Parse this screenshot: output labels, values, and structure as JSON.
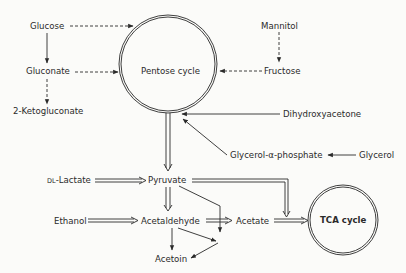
{
  "diagram": {
    "type": "metabolic-pathway",
    "nodes": {
      "glucose": "Glucose",
      "gluconate": "Gluconate",
      "ketogluconate": "2-Ketogluconate",
      "pentose_cycle": "Pentose cycle",
      "mannitol": "Mannitol",
      "fructose": "Fructose",
      "dihydroxyacetone": "Dihydroxyacetone",
      "glycerol_phosphate": "Glycerol-α-phosphate",
      "glycerol": "Glycerol",
      "lactate_prefix": "DL",
      "lactate": "-Lactate",
      "pyruvate": "Pyruvate",
      "ethanol": "Ethanol",
      "acetaldehyde": "Acetaldehyde",
      "acetate": "Acetate",
      "acetoin": "Acetoin",
      "tca_cycle": "TCA cycle"
    },
    "edges": [
      {
        "from": "Glucose",
        "to": "Pentose cycle",
        "style": "dashed"
      },
      {
        "from": "Glucose",
        "to": "Gluconate",
        "style": "solid"
      },
      {
        "from": "Gluconate",
        "to": "Pentose cycle",
        "style": "dashed"
      },
      {
        "from": "Gluconate",
        "to": "2-Ketogluconate",
        "style": "dashed"
      },
      {
        "from": "Mannitol",
        "to": "Fructose",
        "style": "dashed"
      },
      {
        "from": "Fructose",
        "to": "Pentose cycle",
        "style": "dashed"
      },
      {
        "from": "Dihydroxyacetone",
        "to": "Pentose cycle",
        "style": "solid"
      },
      {
        "from": "Glycerol-α-phosphate",
        "to": "Pentose cycle",
        "style": "solid"
      },
      {
        "from": "Glycerol",
        "to": "Glycerol-α-phosphate",
        "style": "solid"
      },
      {
        "from": "Pentose cycle",
        "to": "Pyruvate",
        "style": "double"
      },
      {
        "from": "DL-Lactate",
        "to": "Pyruvate",
        "style": "double"
      },
      {
        "from": "Pyruvate",
        "to": "Acetaldehyde",
        "style": "double"
      },
      {
        "from": "Pyruvate",
        "to": "TCA cycle",
        "style": "double"
      },
      {
        "from": "Pyruvate",
        "to": "Acetoin",
        "style": "solid"
      },
      {
        "from": "Ethanol",
        "to": "Acetaldehyde",
        "style": "double"
      },
      {
        "from": "Acetaldehyde",
        "to": "Acetate",
        "style": "double"
      },
      {
        "from": "Acetaldehyde",
        "to": "Acetoin",
        "style": "solid"
      },
      {
        "from": "Acetate",
        "to": "TCA cycle",
        "style": "double"
      }
    ],
    "colors": {
      "line": "#2a2a2a",
      "background": "#fbfbf9"
    }
  }
}
